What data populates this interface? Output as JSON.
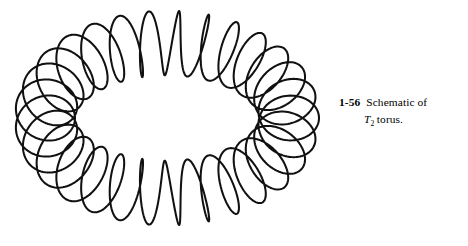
{
  "figure": {
    "name": "toroidal-coil-diagram",
    "stroke_color": "#111111",
    "background_color": "#ffffff",
    "stroke_width": 2.05,
    "geometry": {
      "center_x": 167,
      "center_y": 118,
      "major_radius_x": 122,
      "major_radius_y": 75,
      "minor_radius": 30,
      "turns": 29,
      "tilt_degrees": 0,
      "samples": 2400,
      "squash_y": 0.62
    }
  },
  "caption": {
    "number": "1-56",
    "line_one_text": "Schematic of",
    "symbol_base": "T",
    "symbol_subscript": "2",
    "trailing_text": "torus."
  }
}
